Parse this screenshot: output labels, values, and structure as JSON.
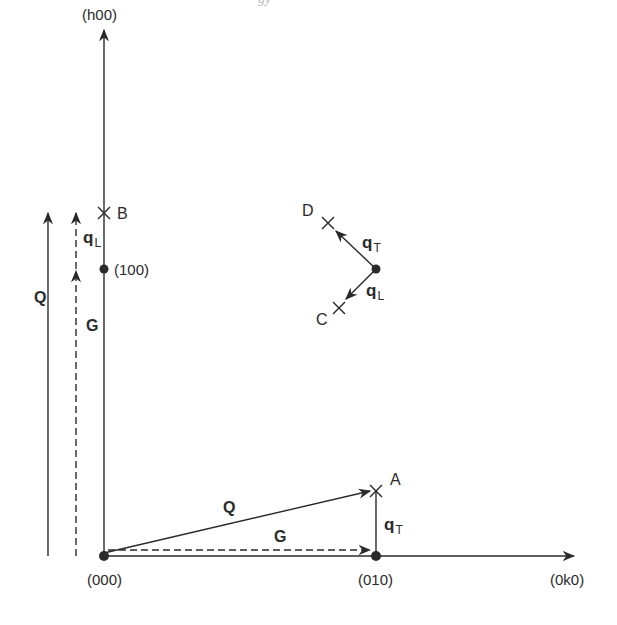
{
  "caption_fragment": "gy",
  "axes": {
    "vertical_label": "(h00)",
    "horizontal_label": "(0k0)"
  },
  "lattice_points": [
    {
      "label": "(000)"
    },
    {
      "label": "(010)"
    },
    {
      "label": "(100)"
    }
  ],
  "scattering_points": {
    "A": "A",
    "B": "B",
    "C": "C",
    "D": "D"
  },
  "vectors": {
    "Q": "Q",
    "G": "G",
    "q": "q",
    "sub_T": "T",
    "sub_L": "L"
  },
  "colors": {
    "ink": "#2a2a2a",
    "background": "#ffffff"
  }
}
